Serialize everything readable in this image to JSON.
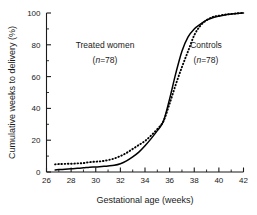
{
  "chart_data": {
    "type": "line",
    "title": "",
    "xlabel": "Gestational age (weeks)",
    "ylabel": "Cumulative weeks to delivery (%)",
    "xlim": [
      26,
      42
    ],
    "ylim": [
      0,
      100
    ],
    "xticks": [
      26,
      28,
      30,
      32,
      34,
      36,
      38,
      40,
      42
    ],
    "yticks": [
      0,
      20,
      40,
      60,
      80,
      100
    ],
    "xtick_labels": [
      "26",
      "28",
      "30",
      "32",
      "34",
      "36",
      "38",
      "40",
      "42"
    ],
    "ytick_labels": [
      "0",
      "20",
      "40",
      "60",
      "80",
      "100"
    ],
    "minor_xticks": [
      27,
      29,
      31,
      33,
      35,
      37,
      39,
      41
    ],
    "minor_yticks": [
      10,
      30,
      50,
      70,
      90
    ],
    "grid": false,
    "legend": "none",
    "x": [
      26.7,
      27.0,
      27.5,
      28.0,
      28.5,
      29.0,
      29.5,
      30.0,
      30.5,
      31.0,
      31.5,
      32.0,
      32.5,
      33.0,
      33.5,
      34.0,
      34.5,
      35.0,
      35.5,
      36.0,
      36.5,
      37.0,
      37.5,
      38.0,
      38.5,
      39.0,
      39.5,
      40.0,
      40.5,
      41.0,
      41.5,
      42.0
    ],
    "series": [
      {
        "name": "Treated women",
        "n": 78,
        "style": "solid",
        "color": "#000000",
        "values": [
          1.3,
          1.5,
          1.8,
          2.0,
          2.3,
          2.6,
          3.0,
          3.2,
          3.5,
          3.8,
          4.2,
          5.2,
          7.0,
          9.5,
          12.5,
          16.5,
          21.0,
          26.0,
          32.0,
          46.0,
          62.0,
          76.0,
          85.0,
          90.0,
          93.0,
          95.5,
          97.0,
          98.0,
          98.8,
          99.3,
          99.7,
          100.0
        ]
      },
      {
        "name": "Controls",
        "n": 78,
        "style": "dotted",
        "color": "#000000",
        "values": [
          4.8,
          5.0,
          5.1,
          5.2,
          5.4,
          5.6,
          6.2,
          6.5,
          6.8,
          7.5,
          8.5,
          10.0,
          12.0,
          14.5,
          17.0,
          19.5,
          23.0,
          27.0,
          32.0,
          43.0,
          55.0,
          66.0,
          76.0,
          86.0,
          92.0,
          95.5,
          97.5,
          98.3,
          99.0,
          99.4,
          99.8,
          100.0
        ]
      }
    ],
    "annotations": [
      {
        "id": "treated-label",
        "line1": "Treated women",
        "line2_prefix": "(",
        "line2_italic": "n",
        "line2_suffix": "=78)",
        "x": 31.5,
        "y": 72
      },
      {
        "id": "controls-label",
        "line1": "Controls",
        "line2_prefix": "(",
        "line2_italic": "n",
        "line2_suffix": "=78)",
        "x": 38.6,
        "y": 72
      }
    ]
  },
  "axes": {
    "xlabel": "Gestational age (weeks)",
    "ylabel": "Cumulative weeks to delivery (%)"
  },
  "annotations": {
    "treated": {
      "label": "Treated women",
      "n_open": "(",
      "n_italic": "n",
      "n_close": "=78)"
    },
    "controls": {
      "label": "Controls",
      "n_open": "(",
      "n_italic": "n",
      "n_close": "=78)"
    }
  }
}
